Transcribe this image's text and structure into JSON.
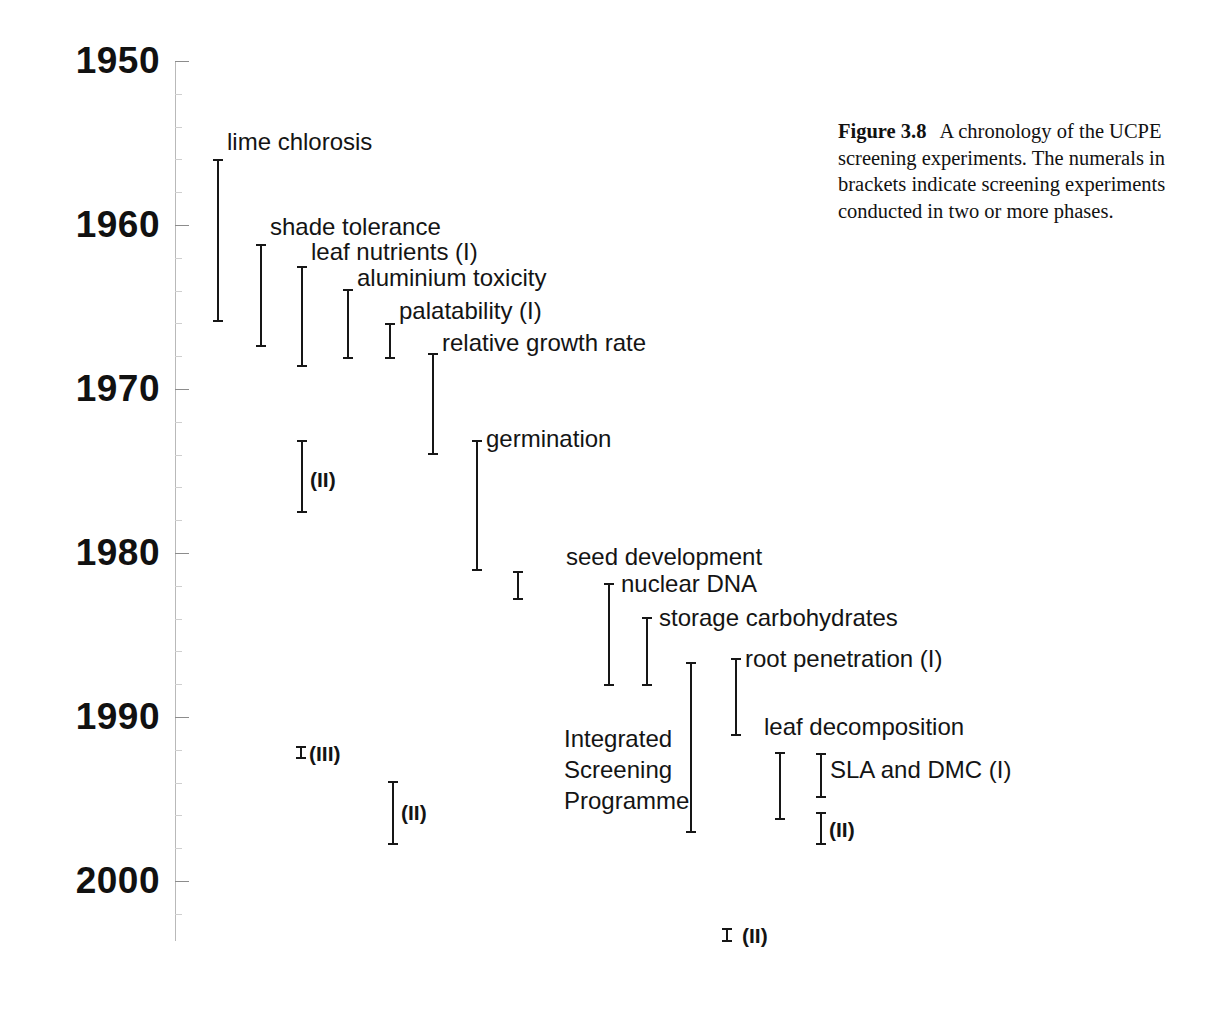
{
  "figure": {
    "number_label": "Figure 3.8",
    "caption_text": "A chronology of the UCPE screening experiments. The numerals in brackets indicate screening experiments conducted in two or more phases."
  },
  "axis": {
    "orientation": "vertical",
    "year_labels": [
      "1950",
      "1960",
      "1970",
      "1980",
      "1990",
      "2000"
    ],
    "year_values": [
      1950,
      1960,
      1970,
      1980,
      1990,
      2000
    ],
    "range": [
      1950,
      2003
    ]
  },
  "chart_data": {
    "type": "timeline",
    "title": "A chronology of the UCPE screening experiments",
    "xlabel": "",
    "ylabel": "Year",
    "ylim": [
      1950,
      2003
    ],
    "grid": false,
    "legend": "none",
    "axis_ticks": [
      1950,
      1960,
      1970,
      1980,
      1990,
      2000
    ],
    "note": "Each entry is a vertical bracket spanning the start and end year of a screening experiment; numerals in brackets indicate experiments run in two or more phases.",
    "entries": [
      {
        "label": "lime chlorosis",
        "start": 1956.0,
        "end": 1965.8,
        "phase": "",
        "column": 0
      },
      {
        "label": "shade tolerance",
        "start": 1961.2,
        "end": 1967.2,
        "phase": "",
        "column": 1
      },
      {
        "label": "leaf nutrients (I)",
        "start": 1962.5,
        "end": 1968.5,
        "phase": "I",
        "column": 2
      },
      {
        "label": "aluminium toxicity",
        "start": 1963.9,
        "end": 1968.0,
        "phase": "",
        "column": 3
      },
      {
        "label": "palatability (I)",
        "start": 1966.0,
        "end": 1968.0,
        "phase": "I",
        "column": 4
      },
      {
        "label": "relative growth rate",
        "start": 1967.9,
        "end": 1975.9,
        "phase": "",
        "column": 5
      },
      {
        "label": "germination",
        "start": 1973.2,
        "end": 1981.1,
        "phase": "",
        "column": 6
      },
      {
        "label": "seed development",
        "start": 1981.2,
        "end": 1982.9,
        "phase": "",
        "column": 7
      },
      {
        "label": "nuclear DNA",
        "start": 1982.0,
        "end": 1988.1,
        "phase": "",
        "column": 8
      },
      {
        "label": "storage carbohydrates",
        "start": 1984.1,
        "end": 1988.1,
        "phase": "",
        "column": 9
      },
      {
        "label": "Integrated Screening Programme",
        "start": 1986.9,
        "end": 1997.1,
        "phase": "",
        "column": 10
      },
      {
        "label": "root penetration (I)",
        "start": 1986.6,
        "end": 1991.2,
        "phase": "I",
        "column": 11
      },
      {
        "label": "leaf decomposition",
        "start": 1992.2,
        "end": 1996.3,
        "phase": "",
        "column": 12
      },
      {
        "label": "SLA and DMC (I)",
        "start": 1992.3,
        "end": 1994.9,
        "phase": "I",
        "column": 13
      }
    ],
    "phase_markers": [
      {
        "label": "(II)",
        "start": 1976.9,
        "end": 1981.3,
        "belongs_to": "leaf nutrients",
        "column": 2
      },
      {
        "label": "(III)",
        "start": 1991.8,
        "end": 1992.3,
        "belongs_to": "leaf nutrients",
        "column": 2
      },
      {
        "label": "(II)",
        "start": 1993.0,
        "end": 1996.8,
        "belongs_to": "palatability",
        "column": 4
      },
      {
        "label": "(II)",
        "start": 1994.9,
        "end": 1996.8,
        "belongs_to": "SLA and DMC",
        "column": 13
      },
      {
        "label": "(II)",
        "start": 2002.3,
        "end": 2002.9,
        "belongs_to": "root penetration",
        "column": 11
      }
    ]
  },
  "entries": {
    "lime_chlorosis": "lime chlorosis",
    "shade_tolerance": "shade tolerance",
    "leaf_nutrients": "leaf nutrients  (I)",
    "aluminium_toxicity": "aluminium toxicity",
    "palatability": "palatability  (I)",
    "relative_growth_rate": "relative growth rate",
    "germination": "germination",
    "seed_development": "seed development",
    "nuclear_dna": "nuclear DNA",
    "storage_carbohydrates": "storage carbohydrates",
    "integrated_screening_programme": "Integrated Screening Programme",
    "root_penetration": "root penetration (I)",
    "leaf_decomposition": "leaf decomposition",
    "sla_and_dmc": "SLA and DMC (I)"
  },
  "phase_tags": {
    "leaf_nutrients_ii": "(II)",
    "leaf_nutrients_iii": "(III)",
    "palatability_ii": "(II)",
    "sla_dmc_ii": "(II)",
    "root_penetration_ii": "(II)"
  },
  "colors": {
    "ink": "#171717",
    "axis": "#b9b9b9",
    "tick": "#8c8c8c",
    "background": "#ffffff"
  }
}
